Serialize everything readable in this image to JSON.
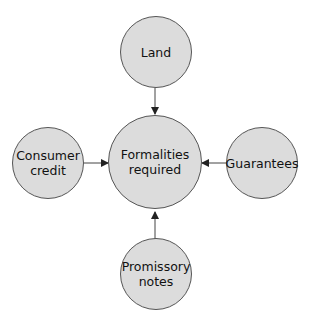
{
  "diagram": {
    "center": {
      "label": "Formalities\nrequired"
    },
    "nodes": [
      {
        "id": "top",
        "label": "Land"
      },
      {
        "id": "left",
        "label": "Consumer\ncredit"
      },
      {
        "id": "right",
        "label": "Guarantees"
      },
      {
        "id": "bottom",
        "label": "Promissory\nnotes"
      }
    ],
    "colors": {
      "fill": "#dcdcdc",
      "stroke": "#555555",
      "arrow": "#222222"
    }
  }
}
